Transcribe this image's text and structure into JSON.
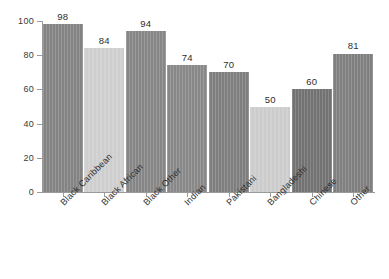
{
  "chart_data": {
    "type": "bar",
    "title": "",
    "subtitle": "",
    "xlabel": "",
    "ylabel": "",
    "categories": [
      "Black Caribbean",
      "Black African",
      "Black Other",
      "Indian",
      "Pakistani",
      "Bangladeshi",
      "Chinese",
      "Other"
    ],
    "values": [
      98,
      84,
      94,
      74,
      70,
      50,
      60,
      81
    ],
    "value_labels": [
      "98",
      "84",
      "94",
      "74",
      "70",
      "50",
      "60",
      "81"
    ],
    "bar_colors": [
      "#8a8a8a",
      "#d2d2d2",
      "#8d8d8d",
      "#8f8f8f",
      "#858585",
      "#d0d0d0",
      "#787878",
      "#868686"
    ],
    "ylim": [
      0,
      100
    ],
    "yticks": [
      0,
      20,
      40,
      60,
      80,
      100
    ],
    "ytick_labels": [
      "0",
      "20",
      "40",
      "60",
      "80",
      "100"
    ],
    "grid": false,
    "legend": null,
    "legend_position": "none",
    "axis_color": "#9a9a9a",
    "text_color": "#2e2e2e",
    "background": "#ffffff",
    "label_rotation_deg": -45
  }
}
